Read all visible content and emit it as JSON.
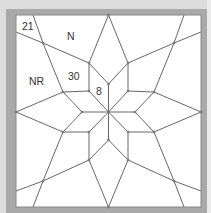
{
  "diagram": {
    "canvas": {
      "width": 211,
      "height": 213
    },
    "frame": {
      "x": 16,
      "y": 15,
      "width": 185,
      "height": 192,
      "fill": "#ffffff",
      "border_color": "#a9a9a9",
      "outer_color": "#dcdcdc"
    },
    "line_color": "#555555",
    "marker_color": "#7a7a7a",
    "labels": [
      {
        "id": "label-21",
        "text": "21",
        "x": 22,
        "y": 30
      },
      {
        "id": "label-n",
        "text": "N",
        "x": 67,
        "y": 40
      },
      {
        "id": "label-nr",
        "text": "NR",
        "x": 29,
        "y": 85
      },
      {
        "id": "label-30",
        "text": "30",
        "x": 68,
        "y": 80
      },
      {
        "id": "label-8",
        "text": "8",
        "x": 96,
        "y": 95
      }
    ],
    "vertices": {
      "center": [
        108.5,
        112
      ],
      "inner": [
        [
          108.5,
          84
        ],
        [
          128,
          91
        ],
        [
          135,
          112
        ],
        [
          128,
          132
        ],
        [
          108.5,
          140
        ],
        [
          89,
          132
        ],
        [
          82,
          112
        ],
        [
          89,
          91
        ]
      ],
      "tips": [
        [
          89,
          63
        ],
        [
          128,
          63
        ],
        [
          154,
          92
        ],
        [
          154,
          132
        ],
        [
          128,
          160
        ],
        [
          89,
          160
        ],
        [
          63,
          132
        ],
        [
          63,
          92
        ]
      ],
      "corner_points": [
        [
          43,
          43
        ],
        [
          174,
          43
        ],
        [
          174,
          181
        ],
        [
          43,
          181
        ]
      ],
      "edge_mid": [
        [
          108.5,
          15
        ],
        [
          201,
          112
        ],
        [
          108.5,
          207
        ],
        [
          16,
          112
        ]
      ],
      "edge_side": [
        [
          33,
          15
        ],
        [
          184,
          15
        ],
        [
          201,
          32
        ],
        [
          201,
          191
        ],
        [
          184,
          207
        ],
        [
          33,
          207
        ],
        [
          16,
          191
        ],
        [
          16,
          32
        ]
      ]
    }
  }
}
